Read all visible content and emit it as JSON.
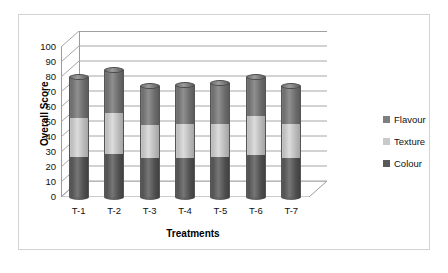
{
  "chart_data": {
    "type": "bar",
    "subtype": "stacked-3d-cylinder",
    "title": "",
    "xlabel": "Treatments",
    "ylabel": "Overall Score",
    "categories": [
      "T-1",
      "T-2",
      "T-3",
      "T-4",
      "T-5",
      "T-6",
      "T-7"
    ],
    "series": [
      {
        "name": "Colour",
        "color": "#595959",
        "values": [
          27,
          29,
          26,
          26,
          27,
          28,
          26
        ]
      },
      {
        "name": "Texture",
        "color": "#c9c9c9",
        "values": [
          26,
          27,
          22,
          23,
          22,
          26,
          23
        ]
      },
      {
        "name": "Flavour",
        "color": "#7f7f7f",
        "values": [
          27,
          29,
          26,
          26,
          27,
          26,
          25
        ]
      }
    ],
    "totals": [
      80,
      85,
      74,
      75,
      76,
      80,
      74
    ],
    "ylim": [
      0,
      100
    ],
    "yticks": [
      0,
      10,
      20,
      30,
      40,
      50,
      60,
      70,
      80,
      90,
      100
    ],
    "ytick_labels": [
      "0",
      "10",
      "20",
      "30",
      "40",
      "50",
      "60",
      "70",
      "80",
      "90",
      "100"
    ],
    "grid": true,
    "legend_position": "right",
    "legend_order": [
      "Flavour",
      "Texture",
      "Colour"
    ]
  },
  "axes": {
    "y_title": "Overall Score",
    "x_title": "Treatments"
  },
  "legend": {
    "items": [
      {
        "label": "Flavour",
        "color": "#7f7f7f"
      },
      {
        "label": "Texture",
        "color": "#c9c9c9"
      },
      {
        "label": "Colour",
        "color": "#595959"
      }
    ]
  }
}
